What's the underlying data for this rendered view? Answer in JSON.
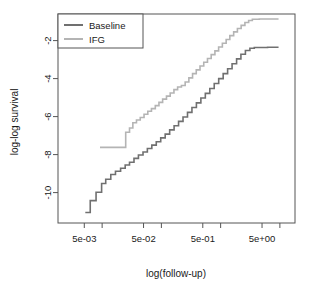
{
  "chart_data": {
    "type": "line",
    "title": "",
    "xlabel": "log(follow-up)",
    "ylabel": "log-log survival",
    "grid": false,
    "legend_position": "top-left",
    "x_scale": "log",
    "xlim": [
      0.0018,
      18
    ],
    "ylim": [
      -11.6,
      -0.6
    ],
    "xticks": [
      0.005,
      0.05,
      0.5,
      5
    ],
    "xticklabels": [
      "5e-03",
      "5e-02",
      "5e-01",
      "5e+00"
    ],
    "x_minor_ticks": [
      0.01,
      0.1,
      1,
      10
    ],
    "yticks": [
      -2,
      -4,
      -6,
      -8,
      -10
    ],
    "yticklabels": [
      "-2",
      "-4",
      "-6",
      "-8",
      "-10"
    ],
    "series": [
      {
        "name": "Baseline",
        "color": "#707070",
        "step": true,
        "points": [
          [
            0.0052,
            -11.05
          ],
          [
            0.0063,
            -11.05
          ],
          [
            0.0063,
            -10.42
          ],
          [
            0.0079,
            -10.42
          ],
          [
            0.0079,
            -9.98
          ],
          [
            0.0098,
            -9.98
          ],
          [
            0.0098,
            -9.52
          ],
          [
            0.0115,
            -9.52
          ],
          [
            0.0115,
            -9.3
          ],
          [
            0.014,
            -9.3
          ],
          [
            0.014,
            -9.05
          ],
          [
            0.0168,
            -9.05
          ],
          [
            0.0168,
            -8.88
          ],
          [
            0.0205,
            -8.88
          ],
          [
            0.0205,
            -8.72
          ],
          [
            0.0245,
            -8.72
          ],
          [
            0.0245,
            -8.55
          ],
          [
            0.029,
            -8.55
          ],
          [
            0.029,
            -8.4
          ],
          [
            0.0345,
            -8.4
          ],
          [
            0.0345,
            -8.2
          ],
          [
            0.041,
            -8.2
          ],
          [
            0.041,
            -8.02
          ],
          [
            0.049,
            -8.02
          ],
          [
            0.049,
            -7.86
          ],
          [
            0.058,
            -7.86
          ],
          [
            0.058,
            -7.68
          ],
          [
            0.069,
            -7.68
          ],
          [
            0.069,
            -7.5
          ],
          [
            0.082,
            -7.5
          ],
          [
            0.082,
            -7.32
          ],
          [
            0.0975,
            -7.32
          ],
          [
            0.0975,
            -7.12
          ],
          [
            0.116,
            -7.12
          ],
          [
            0.116,
            -6.92
          ],
          [
            0.138,
            -6.92
          ],
          [
            0.138,
            -6.7
          ],
          [
            0.164,
            -6.7
          ],
          [
            0.164,
            -6.48
          ],
          [
            0.195,
            -6.48
          ],
          [
            0.195,
            -6.25
          ],
          [
            0.232,
            -6.25
          ],
          [
            0.232,
            -6.02
          ],
          [
            0.276,
            -6.02
          ],
          [
            0.276,
            -5.78
          ],
          [
            0.328,
            -5.78
          ],
          [
            0.328,
            -5.52
          ],
          [
            0.39,
            -5.52
          ],
          [
            0.39,
            -5.28
          ],
          [
            0.464,
            -5.28
          ],
          [
            0.464,
            -5.02
          ],
          [
            0.552,
            -5.02
          ],
          [
            0.552,
            -4.78
          ],
          [
            0.656,
            -4.78
          ],
          [
            0.656,
            -4.52
          ],
          [
            0.78,
            -4.52
          ],
          [
            0.78,
            -4.26
          ],
          [
            0.928,
            -4.26
          ],
          [
            0.928,
            -4.0
          ],
          [
            1.104,
            -4.0
          ],
          [
            1.104,
            -3.74
          ],
          [
            1.312,
            -3.74
          ],
          [
            1.312,
            -3.48
          ],
          [
            1.56,
            -3.48
          ],
          [
            1.56,
            -3.22
          ],
          [
            1.86,
            -3.22
          ],
          [
            1.86,
            -2.96
          ],
          [
            2.2,
            -2.96
          ],
          [
            2.2,
            -2.72
          ],
          [
            2.62,
            -2.72
          ],
          [
            2.62,
            -2.52
          ],
          [
            3.12,
            -2.52
          ],
          [
            3.12,
            -2.4
          ],
          [
            3.7,
            -2.4
          ],
          [
            3.7,
            -2.36
          ],
          [
            6.2,
            -2.36
          ],
          [
            6.2,
            -2.35
          ],
          [
            9.5,
            -2.35
          ]
        ]
      },
      {
        "name": "IFG",
        "color": "#b4b4b4",
        "step": true,
        "points": [
          [
            0.0092,
            -7.62
          ],
          [
            0.0205,
            -7.62
          ],
          [
            0.0205,
            -7.62
          ],
          [
            0.025,
            -7.62
          ],
          [
            0.025,
            -6.82
          ],
          [
            0.029,
            -6.82
          ],
          [
            0.029,
            -6.6
          ],
          [
            0.033,
            -6.6
          ],
          [
            0.033,
            -6.32
          ],
          [
            0.038,
            -6.32
          ],
          [
            0.038,
            -6.18
          ],
          [
            0.044,
            -6.18
          ],
          [
            0.044,
            -6.05
          ],
          [
            0.051,
            -6.05
          ],
          [
            0.051,
            -5.88
          ],
          [
            0.059,
            -5.88
          ],
          [
            0.059,
            -5.72
          ],
          [
            0.068,
            -5.72
          ],
          [
            0.068,
            -5.58
          ],
          [
            0.079,
            -5.58
          ],
          [
            0.079,
            -5.42
          ],
          [
            0.091,
            -5.42
          ],
          [
            0.091,
            -5.25
          ],
          [
            0.105,
            -5.25
          ],
          [
            0.105,
            -5.08
          ],
          [
            0.122,
            -5.08
          ],
          [
            0.122,
            -4.92
          ],
          [
            0.141,
            -4.92
          ],
          [
            0.141,
            -4.76
          ],
          [
            0.163,
            -4.76
          ],
          [
            0.163,
            -4.58
          ],
          [
            0.188,
            -4.58
          ],
          [
            0.188,
            -4.44
          ],
          [
            0.218,
            -4.44
          ],
          [
            0.218,
            -4.36
          ],
          [
            0.252,
            -4.36
          ],
          [
            0.252,
            -4.18
          ],
          [
            0.291,
            -4.18
          ],
          [
            0.291,
            -3.96
          ],
          [
            0.336,
            -3.96
          ],
          [
            0.336,
            -3.74
          ],
          [
            0.388,
            -3.74
          ],
          [
            0.388,
            -3.54
          ],
          [
            0.449,
            -3.54
          ],
          [
            0.449,
            -3.34
          ],
          [
            0.519,
            -3.34
          ],
          [
            0.519,
            -3.14
          ],
          [
            0.6,
            -3.14
          ],
          [
            0.6,
            -2.94
          ],
          [
            0.693,
            -2.94
          ],
          [
            0.693,
            -2.74
          ],
          [
            0.801,
            -2.74
          ],
          [
            0.801,
            -2.54
          ],
          [
            0.925,
            -2.54
          ],
          [
            0.925,
            -2.34
          ],
          [
            1.07,
            -2.34
          ],
          [
            1.07,
            -2.14
          ],
          [
            1.24,
            -2.14
          ],
          [
            1.24,
            -1.94
          ],
          [
            1.43,
            -1.94
          ],
          [
            1.43,
            -1.74
          ],
          [
            1.66,
            -1.74
          ],
          [
            1.66,
            -1.54
          ],
          [
            1.92,
            -1.54
          ],
          [
            1.92,
            -1.36
          ],
          [
            2.22,
            -1.36
          ],
          [
            2.22,
            -1.2
          ],
          [
            2.57,
            -1.2
          ],
          [
            2.57,
            -1.05
          ],
          [
            2.97,
            -1.05
          ],
          [
            2.97,
            -0.94
          ],
          [
            3.43,
            -0.94
          ],
          [
            3.43,
            -0.88
          ],
          [
            4.5,
            -0.88
          ],
          [
            4.5,
            -0.86
          ],
          [
            9.5,
            -0.86
          ]
        ]
      }
    ]
  },
  "legend": {
    "entries": [
      {
        "label": "Baseline",
        "color": "#707070"
      },
      {
        "label": "IFG",
        "color": "#b4b4b4"
      }
    ]
  },
  "axes": {
    "x_title": "log(follow-up)",
    "y_title": "log-log survival",
    "x_tick_labels": [
      "5e-03",
      "5e-02",
      "5e-01",
      "5e+00"
    ],
    "y_tick_labels": [
      "-2",
      "-4",
      "-6",
      "-8",
      "-10"
    ]
  }
}
